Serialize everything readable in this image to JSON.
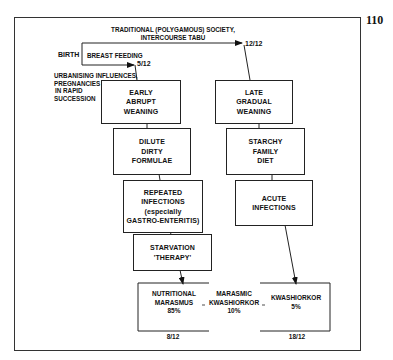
{
  "page_number": "110",
  "header": {
    "birth_label": "BIRTH",
    "breast_feeding_label": "BREAST FEEDING",
    "traditional_label_line1": "TRADITIONAL (POLYGAMOUS) SOCIETY,",
    "traditional_label_line2": "INTERCOURSE TABU",
    "urbanising_line1": "URBANISING INFLUENCES,",
    "urbanising_line2": "PREGNANCIES",
    "urbanising_line3": "IN RAPID",
    "urbanising_line4": "SUCCESSION",
    "age_5_12": "5/12",
    "age_12_12": "12/12"
  },
  "left_path": [
    {
      "lines": [
        "EARLY",
        "ABRUPT",
        "WEANING"
      ]
    },
    {
      "lines": [
        "DILUTE",
        "DIRTY",
        "FORMULAE"
      ]
    },
    {
      "lines": [
        "REPEATED",
        "INFECTIONS",
        "(especially",
        "GASTRO-ENTERITIS)"
      ]
    },
    {
      "lines": [
        "STARVATION",
        "'THERAPY'"
      ]
    }
  ],
  "right_path": [
    {
      "lines": [
        "LATE",
        "GRADUAL",
        "WEANING"
      ]
    },
    {
      "lines": [
        "STARCHY",
        "FAMILY",
        "DIET"
      ]
    },
    {
      "lines": [
        "ACUTE",
        "INFECTIONS"
      ]
    }
  ],
  "outcomes": {
    "nutritional_marasmus": {
      "line1": "NUTRITIONAL",
      "line2": "MARASMUS",
      "pct": "85%",
      "age": "8/12"
    },
    "marasmic_kwashiorkor": {
      "line1": "MARASMIC",
      "line2": "KWASHIORKOR",
      "pct": "10%"
    },
    "kwashiorkor": {
      "line1": "KWASHIORKOR",
      "pct": "5%",
      "age": "18/12"
    }
  },
  "colors": {
    "line": "#222222",
    "background": "#ffffff"
  }
}
